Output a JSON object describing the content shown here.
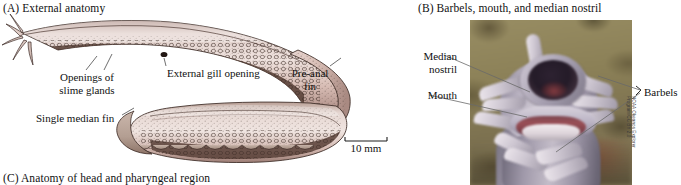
{
  "figure": {
    "panel_a": {
      "caption": "(A)  External anatomy",
      "labels": {
        "openings_of_slime_glands": "Openings of\nslime glands",
        "external_gill_opening": "External gill opening",
        "pre_anal_fin": "Pre-anal\nfin",
        "single_median_fin": "Single median fin",
        "scale_bar": "10 mm"
      }
    },
    "panel_b": {
      "caption": "(B)  Barbels, mouth, and median nostril",
      "labels": {
        "median_nostril": "Median\nnostril",
        "mouth": "Mouth",
        "barbels": "Barbels"
      },
      "photo": {
        "subject": "hagfish-head-photograph",
        "credit_line_1": "NOAA Okeanos Explorer",
        "credit_line_2": "Program/CC BY 2.0"
      }
    },
    "panel_c": {
      "caption": "(C)  Anatomy of head and pharyngeal region"
    }
  },
  "colors": {
    "page_background": "#ffffff",
    "text": "#111111",
    "leader_line": "#5a5a5a",
    "illustration_body_light": "#e8d8d4",
    "illustration_body_mid": "#cdb4ad",
    "illustration_body_shadow": "#8d7068",
    "illustration_outline": "#3a2a26",
    "photo_background": "#8d8259",
    "photo_subject": "#c4bdc9"
  }
}
